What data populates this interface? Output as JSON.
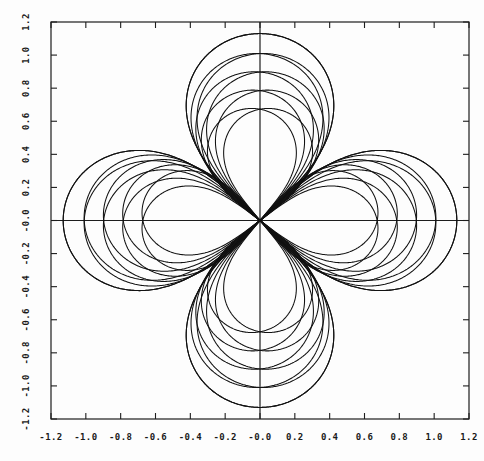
{
  "figure": {
    "background_color": "#fdfdfd",
    "line_color": "#111111",
    "axis_color": "#1d1d1d",
    "width": 484,
    "height": 461
  },
  "chart_data": {
    "type": "line",
    "title": "",
    "xlabel": "",
    "ylabel": "",
    "grid": false,
    "legend": "none",
    "xlim": [
      -1.2,
      1.2
    ],
    "ylim": [
      -1.2,
      1.2
    ],
    "xticks": [
      -1.2,
      -1.0,
      -0.8,
      -0.6,
      -0.4,
      -0.2,
      -0.0,
      0.2,
      0.4,
      0.6,
      0.8,
      1.0,
      1.2
    ],
    "yticks": [
      -1.2,
      -1.0,
      -0.8,
      -0.6,
      -0.4,
      -0.2,
      -0.0,
      0.2,
      0.4,
      0.6,
      0.8,
      1.0,
      1.2
    ],
    "xticklabels": [
      "-1.2",
      "-1.0",
      "-0.8",
      "-0.6",
      "-0.4",
      "-0.2",
      "-0.0",
      "0.2",
      "0.4",
      "0.6",
      "0.8",
      "1.0",
      "1.2"
    ],
    "yticklabels": [
      "-1.2",
      "-1.0",
      "-0.8",
      "-0.6",
      "-0.4",
      "-0.2",
      "-0.0",
      "0.2",
      "0.4",
      "0.6",
      "0.8",
      "1.0",
      "1.2"
    ],
    "curve_family": {
      "form": "polar_rose",
      "petals": 4,
      "n_curves": 5,
      "amplitudes": [
        1.13,
        1.01,
        0.9,
        0.79,
        0.68
      ],
      "rotations_deg": [
        0,
        1.6,
        3.2,
        4.8,
        6.4
      ],
      "tip_radii": [
        1.13,
        1.01,
        0.9,
        0.79,
        0.68
      ],
      "lobe_tips": {
        "top": [
          1.13,
          1.01,
          0.9,
          0.79,
          0.68
        ],
        "bottom": [
          -1.13,
          -1.01,
          -0.9,
          -0.79,
          -0.68
        ],
        "right": [
          1.13,
          1.01,
          0.9,
          0.79,
          0.68
        ],
        "left": [
          -1.13,
          -1.01,
          -0.9,
          -0.79,
          -0.68
        ]
      }
    },
    "axes_style": {
      "frame": "box",
      "zero_lines": true,
      "tick_direction": "in",
      "y_tick_label_rotation": 90
    }
  }
}
